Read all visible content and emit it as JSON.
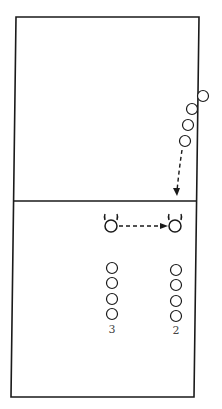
{
  "diagram": {
    "type": "volleyball-drill-court",
    "court": {
      "stroke": "#1a1a1a",
      "background": "#ffffff"
    },
    "players_top": [
      {
        "cx": 203,
        "cy": 96
      },
      {
        "cx": 192,
        "cy": 109
      },
      {
        "cx": 188,
        "cy": 125
      },
      {
        "cx": 185,
        "cy": 141
      }
    ],
    "players_bottom": {
      "column_3": {
        "label": "3",
        "cx": 112,
        "cys": [
          268,
          283,
          299,
          314
        ]
      },
      "column_2": {
        "label": "2",
        "cx": 176,
        "cys": [
          270,
          285,
          301,
          316
        ]
      }
    },
    "setters": [
      {
        "name": "setter-start",
        "cx": 111,
        "cy": 226
      },
      {
        "name": "setter-end",
        "cx": 175,
        "cy": 226
      }
    ],
    "labels": {
      "column_3": "3",
      "column_2": "2"
    }
  }
}
